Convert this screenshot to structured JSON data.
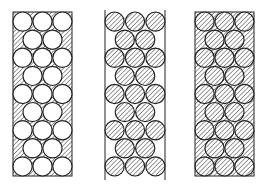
{
  "figure": {
    "colors": {
      "line": "#222222",
      "hatch": "#555555",
      "background": "#ffffff"
    },
    "panels": [
      {
        "id": "panel-1",
        "label": "white spheres in hatched matrix",
        "x": 13,
        "y": 12,
        "w": 59,
        "h": 164,
        "box_fill": "hatch",
        "box_border": "full",
        "sphere_fill": "white"
      },
      {
        "id": "panel-2",
        "label": "hatched spheres between walls",
        "x": 105,
        "y": 12,
        "w": 60,
        "h": 164,
        "box_fill": "white",
        "box_border": "sides",
        "sphere_fill": "hatch"
      },
      {
        "id": "panel-3",
        "label": "hatched spheres in hatched matrix",
        "x": 195,
        "y": 12,
        "w": 59,
        "h": 164,
        "box_fill": "hatch",
        "box_border": "full",
        "sphere_fill": "hatch"
      }
    ],
    "rows": 9,
    "row_pattern": [
      3,
      2,
      3,
      2,
      3,
      2,
      3,
      2,
      3
    ],
    "sphere_radius": 9.6
  }
}
